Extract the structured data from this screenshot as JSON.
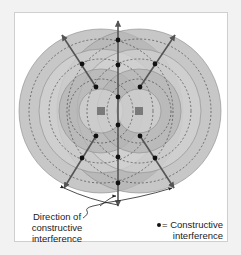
{
  "figure": {
    "direction_label_lines": [
      "Direction of",
      "constructive",
      "interference"
    ],
    "legend_symbol_label": "= Constructive",
    "legend_label_line2": "interference"
  },
  "colors": {
    "wave_fill_dark": "#9a9a9a",
    "wave_fill_light": "#e6e6e6",
    "arrow": "#555555",
    "dot": "#111111",
    "source": "#7a7a7a",
    "frame_border": "#cfcfcf"
  },
  "elements": {
    "sources": 2,
    "wavefront_rings_per_source": 4,
    "constructive_directions": 5,
    "constructive_points": 15
  }
}
